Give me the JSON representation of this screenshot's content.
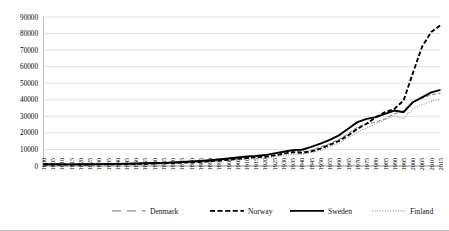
{
  "chart_data": {
    "type": "line",
    "title": "",
    "subtitle": "",
    "xlabel": "",
    "ylabel": "",
    "grid": true,
    "legend_position": "bottom",
    "ylim": [
      0,
      90000
    ],
    "ytick_labels": [
      "0",
      "10000",
      "20000",
      "30000",
      "40000",
      "50000",
      "60000",
      "70000",
      "80000",
      "90000"
    ],
    "yticks": [
      0,
      10000,
      20000,
      30000,
      40000,
      50000,
      60000,
      70000,
      80000,
      90000
    ],
    "xlim": [
      1800,
      2015
    ],
    "x": [
      1800,
      1805,
      1810,
      1815,
      1820,
      1825,
      1830,
      1835,
      1840,
      1845,
      1850,
      1855,
      1860,
      1865,
      1870,
      1875,
      1880,
      1885,
      1890,
      1895,
      1900,
      1905,
      1910,
      1915,
      1920,
      1925,
      1930,
      1935,
      1940,
      1945,
      1950,
      1955,
      1960,
      1965,
      1970,
      1975,
      1980,
      1985,
      1990,
      1995,
      2000,
      2005,
      2010,
      2015
    ],
    "xtick_labels": [
      "1800",
      "1805",
      "1810",
      "1815",
      "1820",
      "1825",
      "1830",
      "1835",
      "1840",
      "1845",
      "1850",
      "1855",
      "1860",
      "1865",
      "1870",
      "1875",
      "1880",
      "1885",
      "1890",
      "1895",
      "1900",
      "1905",
      "1910",
      "1915",
      "1920",
      "1925",
      "1930",
      "1935",
      "1840",
      "1845",
      "1950",
      "1955",
      "1960",
      "1965",
      "1970",
      "1975",
      "1980",
      "1985",
      "1990",
      "1995",
      "2000",
      "2005",
      "2010",
      "2015"
    ],
    "series": [
      {
        "name": "Denmark",
        "color": "#8c8c8c",
        "style": "dashed",
        "values": [
          1100,
          1120,
          1080,
          1050,
          1150,
          1200,
          1250,
          1300,
          1380,
          1450,
          1600,
          1700,
          1850,
          1950,
          2200,
          2500,
          2800,
          3100,
          3500,
          4000,
          4600,
          5100,
          5600,
          5900,
          6400,
          7300,
          8200,
          9000,
          8600,
          9400,
          11500,
          13500,
          16000,
          19500,
          23500,
          25500,
          26500,
          28500,
          31500,
          33500,
          38500,
          41000,
          43000,
          44000
        ]
      },
      {
        "name": "Norway",
        "color": "#000000",
        "style": "heavy-dashed",
        "values": [
          900,
          910,
          870,
          850,
          900,
          950,
          1000,
          1050,
          1100,
          1180,
          1300,
          1400,
          1550,
          1650,
          1850,
          2050,
          2300,
          2500,
          2900,
          3300,
          3800,
          4300,
          4800,
          5400,
          5600,
          6400,
          7400,
          8300,
          8000,
          8800,
          10500,
          12800,
          15200,
          18500,
          22500,
          25500,
          29500,
          32500,
          34500,
          39500,
          56000,
          72000,
          81000,
          85000
        ]
      },
      {
        "name": "Sweden",
        "color": "#000000",
        "style": "solid",
        "values": [
          1050,
          1060,
          1020,
          1000,
          1060,
          1100,
          1160,
          1220,
          1290,
          1380,
          1520,
          1620,
          1780,
          1880,
          2150,
          2450,
          2750,
          3050,
          3450,
          3950,
          4550,
          5150,
          5750,
          6100,
          6600,
          7600,
          8600,
          9600,
          9800,
          11500,
          13500,
          15800,
          18500,
          22500,
          26500,
          28500,
          29500,
          31500,
          33500,
          32500,
          38500,
          41500,
          44500,
          46000
        ]
      },
      {
        "name": "Finland",
        "color": "#9a9a9a",
        "style": "dotted",
        "values": [
          800,
          810,
          780,
          760,
          800,
          840,
          880,
          920,
          970,
          1030,
          1120,
          1200,
          1320,
          1400,
          1580,
          1780,
          2000,
          2200,
          2550,
          2900,
          3300,
          3700,
          4100,
          4400,
          4700,
          5500,
          6200,
          7000,
          7200,
          8000,
          9500,
          11500,
          13800,
          17000,
          20500,
          23000,
          25500,
          28000,
          30500,
          28500,
          34500,
          37000,
          39000,
          40500
        ]
      }
    ]
  },
  "legend": {
    "items": [
      {
        "label": "Denmark",
        "style": "dashed",
        "color": "#8c8c8c"
      },
      {
        "label": "Norway",
        "style": "heavy-dashed",
        "color": "#000000"
      },
      {
        "label": "Sweden",
        "style": "solid",
        "color": "#000000"
      },
      {
        "label": "Finland",
        "style": "dotted",
        "color": "#9a9a9a"
      }
    ]
  },
  "colors": {
    "gridline": "#d9d9d9",
    "axis": "#bfbfbf",
    "background": "#ffffff",
    "text": "#000000"
  }
}
